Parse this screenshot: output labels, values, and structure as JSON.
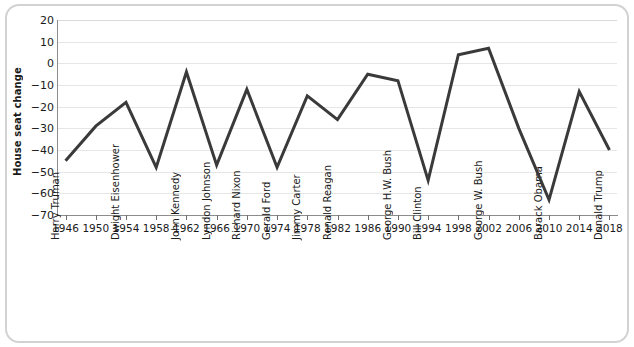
{
  "figure": {
    "ylabel": "House seat change",
    "background": "#ffffff",
    "frame_color": "#d2d2d2",
    "line_color": "#3a3a3a",
    "grid_color": "#e6e6e6"
  },
  "chart_data": {
    "type": "line",
    "title": "",
    "xlabel": "",
    "ylabel": "House seat change",
    "ylim": [
      -70,
      20
    ],
    "xlim": [
      1945,
      2019
    ],
    "ytick_labels": [
      "20",
      "10",
      "0",
      "−10",
      "−20",
      "−30",
      "−40",
      "−50",
      "−60",
      "−70"
    ],
    "ytick_values": [
      20,
      10,
      0,
      -10,
      -20,
      -30,
      -40,
      -50,
      -60,
      -70
    ],
    "xtick_labels": [
      "1946",
      "1950",
      "1954",
      "1958",
      "1962",
      "1966",
      "1970",
      "1974",
      "1978",
      "1982",
      "1986",
      "1990",
      "1994",
      "1998",
      "2002",
      "2006",
      "2010",
      "2014",
      "2018"
    ],
    "xtick_values": [
      1946,
      1950,
      1954,
      1958,
      1962,
      1966,
      1970,
      1974,
      1978,
      1982,
      1986,
      1990,
      1994,
      1998,
      2002,
      2006,
      2010,
      2014,
      2018
    ],
    "grid": true,
    "legend": false,
    "x": [
      1946,
      1950,
      1954,
      1958,
      1962,
      1966,
      1970,
      1974,
      1978,
      1982,
      1986,
      1990,
      1994,
      1998,
      2002,
      2006,
      2010,
      2014,
      2018
    ],
    "values": [
      -45,
      -29,
      -18,
      -48,
      -4,
      -47,
      -12,
      -48,
      -15,
      -26,
      -5,
      -8,
      -54,
      4,
      7,
      -30,
      -63,
      -13,
      -40
    ],
    "presidents": [
      {
        "name": "Harry Truman",
        "year": 1946
      },
      {
        "name": "Dwight Eisenhower",
        "year": 1954
      },
      {
        "name": "John Kennedy",
        "year": 1962
      },
      {
        "name": "Lyndon Johnson",
        "year": 1966
      },
      {
        "name": "Richard Nixon",
        "year": 1970
      },
      {
        "name": "Gerald Ford",
        "year": 1974
      },
      {
        "name": "Jimmy Carter",
        "year": 1978
      },
      {
        "name": "Ronald Reagan",
        "year": 1982
      },
      {
        "name": "George H.W. Bush",
        "year": 1990
      },
      {
        "name": "Bill Clinton",
        "year": 1994
      },
      {
        "name": "George W. Bush",
        "year": 2002
      },
      {
        "name": "Barack Obama",
        "year": 2010
      },
      {
        "name": "Donald Trump",
        "year": 2018
      }
    ]
  }
}
